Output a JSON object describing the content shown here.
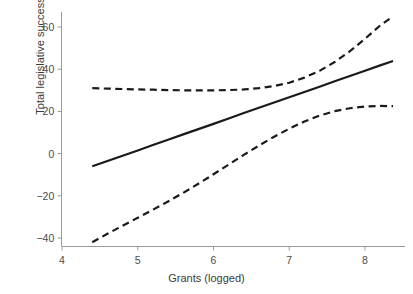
{
  "chart_data": {
    "type": "line",
    "title": "",
    "subtitle": "",
    "xlabel": "Grants (logged)",
    "ylabel": "Total legislative success",
    "xlim": [
      3.85,
      8.55
    ],
    "ylim": [
      -47,
      70
    ],
    "xticks": [
      4,
      5,
      6,
      7,
      8
    ],
    "xtick_labels": [
      "4",
      "5",
      "6",
      "7",
      "8"
    ],
    "yticks": [
      -40,
      -20,
      0,
      20,
      40,
      60
    ],
    "ytick_labels": [
      "−40",
      "−20",
      "0",
      "20",
      "40",
      "60"
    ],
    "grid": false,
    "legend": null,
    "legend_position": "none",
    "annotations": [],
    "x": [
      4.4,
      4.6,
      4.8,
      5.0,
      5.2,
      5.4,
      5.6,
      5.8,
      6.0,
      6.2,
      6.4,
      6.6,
      6.8,
      7.0,
      7.2,
      7.4,
      7.6,
      7.8,
      8.0,
      8.2,
      8.37
    ],
    "series": [
      {
        "name": "Predicted total legislative success",
        "style": "solid",
        "color": "#1a1a1a",
        "values": [
          -6.0,
          -3.5,
          -1.0,
          1.5,
          4.1,
          6.6,
          9.1,
          11.6,
          14.1,
          16.6,
          19.2,
          21.7,
          24.2,
          26.7,
          29.2,
          31.7,
          34.3,
          36.8,
          39.3,
          41.8,
          43.9
        ]
      },
      {
        "name": "Upper 95% confidence bound",
        "style": "dashed",
        "color": "#1a1a1a",
        "values": [
          31.0,
          30.8,
          30.6,
          30.4,
          30.3,
          30.1,
          30.0,
          30.0,
          30.0,
          30.1,
          30.4,
          31.0,
          32.0,
          33.6,
          36.0,
          39.2,
          43.4,
          48.5,
          54.4,
          60.7,
          65.0
        ]
      },
      {
        "name": "Lower 95% confidence bound",
        "style": "dashed",
        "color": "#1a1a1a",
        "values": [
          -42.0,
          -38.0,
          -34.2,
          -30.4,
          -26.6,
          -22.7,
          -18.6,
          -14.3,
          -9.8,
          -5.2,
          -0.6,
          3.8,
          8.0,
          11.8,
          15.2,
          18.0,
          20.1,
          21.5,
          22.3,
          22.6,
          22.5
        ]
      }
    ],
    "axis_color": "#9a9a9a",
    "text_color": "#3b3b3b"
  },
  "figure": {
    "background": "#ffffff"
  }
}
